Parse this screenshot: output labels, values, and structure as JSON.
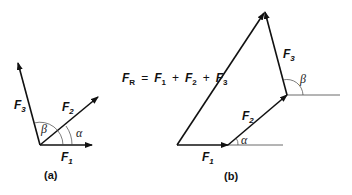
{
  "diagram": {
    "panel_a": {
      "caption": "(a)",
      "vectors": [
        {
          "name": "F",
          "sub": "1"
        },
        {
          "name": "F",
          "sub": "2"
        },
        {
          "name": "F",
          "sub": "3"
        }
      ],
      "angles": {
        "alpha": "α",
        "beta": "β"
      }
    },
    "panel_b": {
      "caption": "(b)",
      "equation": {
        "lhs": "F",
        "lhs_sub": "R",
        "eq": "=",
        "terms": [
          {
            "name": "F",
            "sub": "1"
          },
          {
            "name": "F",
            "sub": "2"
          },
          {
            "name": "F",
            "sub": "3"
          }
        ],
        "plus": "+"
      },
      "vectors": [
        {
          "name": "F",
          "sub": "1"
        },
        {
          "name": "F",
          "sub": "2"
        },
        {
          "name": "F",
          "sub": "3"
        }
      ],
      "angles": {
        "alpha": "α",
        "beta": "β"
      }
    },
    "colors": {
      "stroke": "#111111",
      "thin": "#444444"
    }
  }
}
